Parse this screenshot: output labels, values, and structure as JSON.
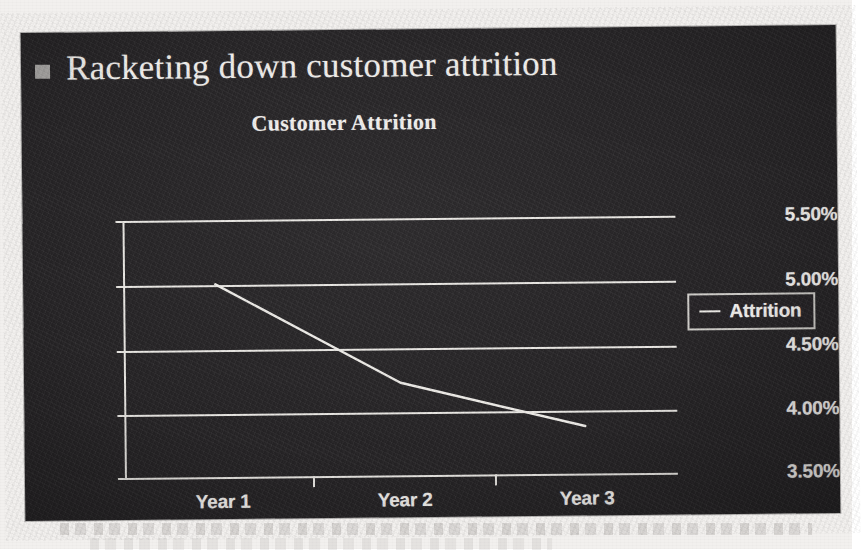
{
  "slide": {
    "bullet_icon": "square-bullet-icon",
    "title": "Racketing down customer attrition",
    "background_color": "#272527",
    "text_color": "#efedea"
  },
  "legend": {
    "position": "right",
    "entries": [
      {
        "label": "Attrition",
        "marker": "line-marker"
      }
    ]
  },
  "chart_data": {
    "type": "line",
    "title": "Customer Attrition",
    "xlabel": "",
    "ylabel": "",
    "categories": [
      "Year 1",
      "Year 2",
      "Year 3"
    ],
    "series": [
      {
        "name": "Attrition",
        "values": [
          5.0,
          4.22,
          3.87
        ]
      }
    ],
    "y_tick_labels": [
      "5.50%",
      "5.00%",
      "4.50%",
      "4.00%",
      "3.50%"
    ],
    "y_tick_values": [
      5.5,
      5.0,
      4.5,
      4.0,
      3.5
    ],
    "ylim": [
      3.5,
      5.5
    ],
    "value_format": "percent",
    "grid": true,
    "legend_position": "right",
    "legend_entries": [
      "Attrition"
    ]
  }
}
